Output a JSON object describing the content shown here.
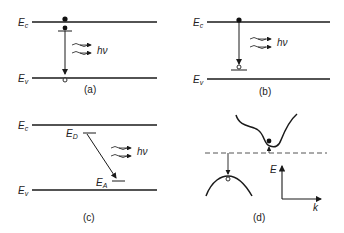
{
  "panels": {
    "a": {
      "caption": "(a)",
      "ec": "E",
      "ec_sub": "c",
      "ev": "E",
      "ev_sub": "v",
      "photon": "hν"
    },
    "b": {
      "caption": "(b)",
      "ec": "E",
      "ec_sub": "c",
      "ev": "E",
      "ev_sub": "v",
      "photon": "hν"
    },
    "c": {
      "caption": "(c)",
      "ec": "E",
      "ec_sub": "c",
      "ev": "E",
      "ev_sub": "v",
      "ed": "E",
      "ed_sub": "D",
      "ea": "E",
      "ea_sub": "A",
      "photon": "hν"
    },
    "d": {
      "caption": "(d)",
      "energy_axis": "E",
      "k_axis": "k"
    }
  },
  "colors": {
    "line": "#1a1a1a",
    "dashed": "#555555"
  }
}
